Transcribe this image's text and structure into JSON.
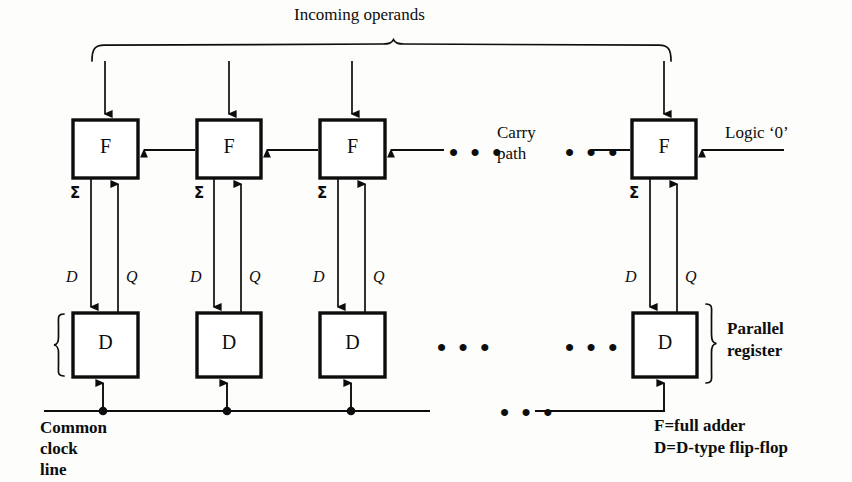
{
  "figure": {
    "background_color": "#fdfdfb",
    "ink_color": "#0d0d0d",
    "top_label": "Incoming operands",
    "carry_label_line1": "Carry",
    "carry_label_line2": "path",
    "logic_zero_label": "Logic ‘0’",
    "parallel_register_line1": "Parallel",
    "parallel_register_line2": "register",
    "clock_label_line1": "Common",
    "clock_label_line2": "clock",
    "clock_label_line3": "line",
    "legend": [
      "F=full adder",
      "D=D-type flip-flop"
    ],
    "ellipsis_glyph": "• • •"
  },
  "adder_cells": [
    {
      "id": "f1",
      "label": "F",
      "sum_label": "Σ",
      "x": 73,
      "y": 120,
      "w": 65,
      "h": 58
    },
    {
      "id": "f2",
      "label": "F",
      "sum_label": "Σ",
      "x": 197,
      "y": 120,
      "w": 64,
      "h": 58
    },
    {
      "id": "f3",
      "label": "F",
      "sum_label": "Σ",
      "x": 320,
      "y": 120,
      "w": 65,
      "h": 58
    },
    {
      "id": "f4",
      "label": "F",
      "sum_label": "Σ",
      "x": 632,
      "y": 120,
      "w": 64,
      "h": 58
    }
  ],
  "register_cells": [
    {
      "id": "d1",
      "label": "D",
      "d_label": "D",
      "q_label": "Q",
      "x": 73,
      "y": 313,
      "w": 65,
      "h": 64
    },
    {
      "id": "d2",
      "label": "D",
      "d_label": "D",
      "q_label": "Q",
      "x": 197,
      "y": 313,
      "w": 64,
      "h": 64
    },
    {
      "id": "d3",
      "label": "D",
      "d_label": "D",
      "q_label": "Q",
      "x": 320,
      "y": 313,
      "w": 65,
      "h": 64
    },
    {
      "id": "d4",
      "label": "D",
      "d_label": "D",
      "q_label": "Q",
      "x": 633,
      "y": 313,
      "w": 64,
      "h": 64
    }
  ]
}
